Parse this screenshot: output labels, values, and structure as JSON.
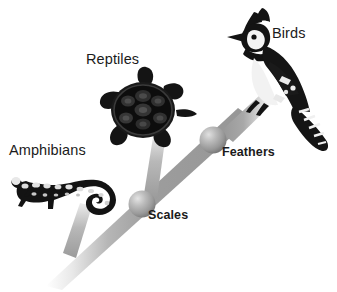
{
  "diagram": {
    "type": "cladogram",
    "title": "",
    "background_color": "#ffffff",
    "branch_color": "#9a9a9a",
    "node_color": "#a6a6a6",
    "silhouette_color": "#111111",
    "text_color": "#1b1b1b",
    "taxa": [
      {
        "id": "amphibians",
        "label": "Amphibians",
        "organism": "salamander",
        "organism_icon": "salamander-silhouette"
      },
      {
        "id": "reptiles",
        "label": "Reptiles",
        "organism": "turtle",
        "organism_icon": "turtle-silhouette"
      },
      {
        "id": "birds",
        "label": "Birds",
        "organism": "blue jay",
        "organism_icon": "bird-silhouette"
      }
    ],
    "nodes": [
      {
        "id": "scales",
        "label": "Scales",
        "trait": "Scales",
        "node_icon": "sphere-node"
      },
      {
        "id": "feathers",
        "label": "Feathers",
        "trait": "Feathers",
        "node_icon": "sphere-node"
      }
    ]
  }
}
